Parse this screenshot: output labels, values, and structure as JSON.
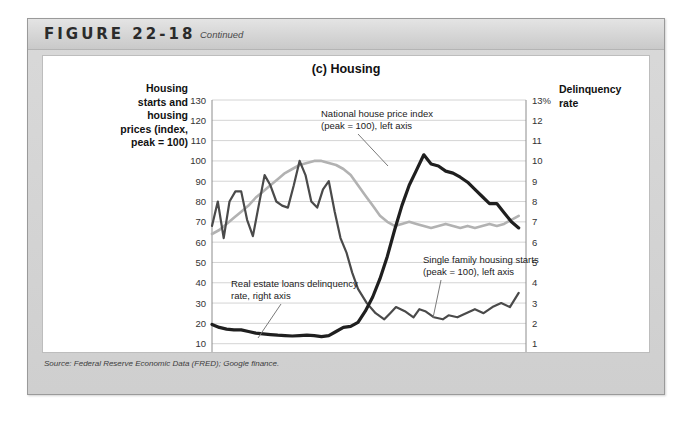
{
  "figure": {
    "number": "FIGURE 22-18",
    "continued": "Continued",
    "source": "Source: Federal Reserve Economic Data (FRED); Google finance."
  },
  "chart_data": {
    "type": "line",
    "title": "(c) Housing",
    "xlabel": "",
    "ylabel": "Housing starts and housing prices (index, peak = 100)",
    "ylabel_right": "Delinquency rate",
    "y_left_title_lines": [
      "Housing",
      "starts and",
      "housing",
      "prices (index,",
      "peak = 100)"
    ],
    "y_right_title_lines": [
      "Delinquency",
      "rate"
    ],
    "xlim": [
      2003,
      2013.75
    ],
    "ylim": [
      0,
      130
    ],
    "ylim_right": [
      0,
      13
    ],
    "grid": true,
    "legend": "annotations",
    "x_ticks": [
      "2003",
      "2004",
      "2005",
      "2006",
      "2007",
      "2008",
      "2009",
      "2010",
      "2011",
      "2012",
      "2013"
    ],
    "y_ticks_left": [
      "0",
      "10",
      "20",
      "30",
      "40",
      "50",
      "60",
      "70",
      "80",
      "90",
      "100",
      "110",
      "120",
      "130"
    ],
    "y_ticks_right": [
      "0",
      "1",
      "2",
      "3",
      "4",
      "5",
      "6",
      "7",
      "8",
      "9",
      "10",
      "11",
      "12",
      "13%"
    ],
    "annotations": [
      {
        "name": "national-house-price-index",
        "lines": [
          "National house price index",
          "(peak = 100), left axis"
        ]
      },
      {
        "name": "real-estate-loans-delinquency-rate",
        "lines": [
          "Real estate loans delinquency",
          "rate, right axis"
        ]
      },
      {
        "name": "single-family-housing-starts",
        "lines": [
          "Single family housing starts",
          "(peak = 100), left axis"
        ]
      }
    ],
    "colors": {
      "house_price_index": "#b2b2b2",
      "housing_starts": "#4a4a4a",
      "delinquency_rate": "#1f1f1f",
      "grid": "#d4d4d4",
      "axis": "#8c8c8c"
    },
    "series": [
      {
        "name": "National house price index (peak = 100), left axis",
        "axis": "left",
        "color": "#b2b2b2",
        "width": 2.6,
        "x": [
          2003.0,
          2003.25,
          2003.5,
          2003.75,
          2004.0,
          2004.25,
          2004.5,
          2004.75,
          2005.0,
          2005.25,
          2005.5,
          2005.75,
          2006.0,
          2006.25,
          2006.5,
          2006.75,
          2007.0,
          2007.25,
          2007.5,
          2007.75,
          2008.0,
          2008.25,
          2008.5,
          2008.75,
          2009.0,
          2009.25,
          2009.5,
          2009.75,
          2010.0,
          2010.25,
          2010.5,
          2010.75,
          2011.0,
          2011.25,
          2011.5,
          2011.75,
          2012.0,
          2012.25,
          2012.5,
          2012.75,
          2013.0,
          2013.25,
          2013.5
        ],
        "y": [
          64,
          66,
          69,
          72,
          75,
          78,
          82,
          85,
          88,
          91,
          94,
          96,
          98,
          99,
          100,
          100,
          99,
          98,
          96,
          93,
          88,
          83,
          78,
          73,
          70,
          68,
          69,
          70,
          69,
          68,
          67,
          68,
          69,
          68,
          67,
          68,
          67,
          68,
          69,
          68,
          69,
          71,
          73
        ]
      },
      {
        "name": "Single family housing starts (peak = 100), left axis",
        "axis": "left",
        "color": "#4a4a4a",
        "width": 2.2,
        "x": [
          2003.0,
          2003.2,
          2003.4,
          2003.6,
          2003.8,
          2004.0,
          2004.2,
          2004.4,
          2004.6,
          2004.8,
          2005.0,
          2005.2,
          2005.4,
          2005.6,
          2005.8,
          2006.0,
          2006.2,
          2006.4,
          2006.6,
          2006.8,
          2007.0,
          2007.2,
          2007.4,
          2007.6,
          2007.8,
          2008.0,
          2008.3,
          2008.6,
          2008.9,
          2009.1,
          2009.3,
          2009.6,
          2009.9,
          2010.1,
          2010.3,
          2010.6,
          2010.9,
          2011.1,
          2011.4,
          2011.7,
          2012.0,
          2012.3,
          2012.6,
          2012.9,
          2013.2,
          2013.5
        ],
        "y": [
          68,
          80,
          62,
          80,
          85,
          85,
          71,
          63,
          78,
          93,
          88,
          80,
          78,
          77,
          88,
          100,
          93,
          80,
          77,
          86,
          90,
          75,
          62,
          55,
          45,
          37,
          30,
          25,
          22,
          25,
          28,
          26,
          23,
          27,
          26,
          23,
          22,
          24,
          23,
          25,
          27,
          25,
          28,
          30,
          28,
          35
        ]
      },
      {
        "name": "Real estate loans delinquency rate, right axis",
        "axis": "right",
        "color": "#1f1f1f",
        "width": 3.2,
        "x": [
          2003.0,
          2003.25,
          2003.5,
          2003.75,
          2004.0,
          2004.25,
          2004.5,
          2004.75,
          2005.0,
          2005.25,
          2005.5,
          2005.75,
          2006.0,
          2006.25,
          2006.5,
          2006.75,
          2007.0,
          2007.25,
          2007.5,
          2007.75,
          2008.0,
          2008.25,
          2008.5,
          2008.75,
          2009.0,
          2009.25,
          2009.5,
          2009.75,
          2010.0,
          2010.25,
          2010.5,
          2010.75,
          2011.0,
          2011.25,
          2011.5,
          2011.75,
          2012.0,
          2012.25,
          2012.5,
          2012.75,
          2013.0,
          2013.25,
          2013.5
        ],
        "y": [
          1.95,
          1.8,
          1.72,
          1.68,
          1.68,
          1.6,
          1.52,
          1.48,
          1.45,
          1.42,
          1.4,
          1.38,
          1.4,
          1.42,
          1.4,
          1.35,
          1.4,
          1.6,
          1.8,
          1.85,
          2.05,
          2.6,
          3.3,
          4.2,
          5.3,
          6.6,
          7.8,
          8.8,
          9.55,
          10.3,
          9.85,
          9.75,
          9.5,
          9.4,
          9.2,
          8.95,
          8.6,
          8.25,
          7.9,
          7.9,
          7.45,
          7.0,
          6.7
        ]
      }
    ]
  }
}
